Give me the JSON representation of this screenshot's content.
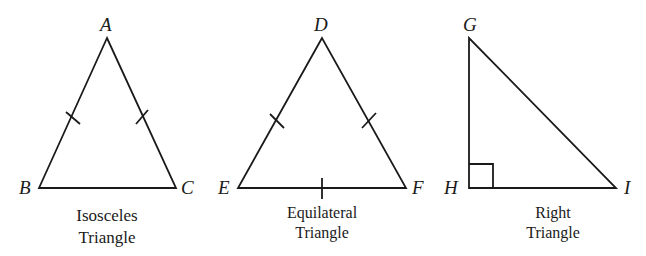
{
  "diagram": {
    "triangles": [
      {
        "type": "isosceles",
        "caption_line1": "Isosceles",
        "caption_line2": "Triangle",
        "vertices": {
          "A": "A",
          "B": "B",
          "C": "C"
        },
        "congruent_marks": [
          "AB",
          "AC"
        ]
      },
      {
        "type": "equilateral",
        "caption_line1": "Equilateral",
        "caption_line2": "Triangle",
        "vertices": {
          "D": "D",
          "E": "E",
          "F": "F"
        },
        "congruent_marks": [
          "DE",
          "DF",
          "EF"
        ]
      },
      {
        "type": "right",
        "caption_line1": "Right",
        "caption_line2": "Triangle",
        "vertices": {
          "G": "G",
          "H": "H",
          "I": "I"
        },
        "right_angle_at": "H"
      }
    ],
    "colors": {
      "stroke": "#1a1a1a",
      "background": "#ffffff"
    }
  }
}
